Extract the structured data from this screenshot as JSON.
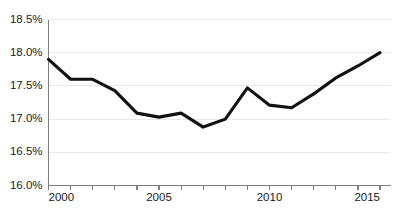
{
  "chart_data": {
    "type": "line",
    "title": "",
    "subtitle": "",
    "xlabel": "",
    "ylabel": "",
    "x": [
      2000,
      2001,
      2002,
      2003,
      2004,
      2005,
      2006,
      2007,
      2008,
      2009,
      2010,
      2011,
      2012,
      2013,
      2014,
      2015
    ],
    "series": [
      {
        "name": "",
        "values": [
          17.9,
          17.6,
          17.6,
          17.43,
          17.09,
          17.03,
          17.09,
          16.88,
          17.0,
          17.47,
          17.21,
          17.17,
          17.38,
          17.62,
          17.8,
          18.0
        ]
      }
    ],
    "xlim": [
      2000,
      2015
    ],
    "ylim": [
      16.0,
      18.5
    ],
    "y_tick_values": [
      18.5,
      18.0,
      17.5,
      17.0,
      16.5,
      16.0
    ],
    "y_tick_labels": [
      "18.5%",
      "18.0%",
      "17.5%",
      "17.0%",
      "16.5%",
      "16.0%"
    ],
    "x_tick_values": [
      2000,
      2001,
      2002,
      2003,
      2004,
      2005,
      2006,
      2007,
      2008,
      2009,
      2010,
      2011,
      2012,
      2013,
      2014,
      2015
    ],
    "x_tick_labels_shown": [
      "2000",
      "2005",
      "2010",
      "2015"
    ],
    "x_labeled_values": [
      2000,
      2005,
      2010,
      2015
    ],
    "grid": "horizontal",
    "legend": "none",
    "colors": {
      "line": "#111111",
      "gridline": "#e9e9e9",
      "axis": "#808080",
      "background": "#ffffff",
      "text": "#1a1a1a"
    }
  },
  "axes": {
    "y_labels": [
      {
        "text": "18.5%",
        "value": 18.5
      },
      {
        "text": "18.0%",
        "value": 18.0
      },
      {
        "text": "17.5%",
        "value": 17.5
      },
      {
        "text": "17.0%",
        "value": 17.0
      },
      {
        "text": "16.5%",
        "value": 16.5
      },
      {
        "text": "16.0%",
        "value": 16.0
      }
    ],
    "x_labels": [
      {
        "text": "2000",
        "value": 2000
      },
      {
        "text": "2005",
        "value": 2005
      },
      {
        "text": "2010",
        "value": 2010
      },
      {
        "text": "2015",
        "value": 2015
      }
    ]
  }
}
